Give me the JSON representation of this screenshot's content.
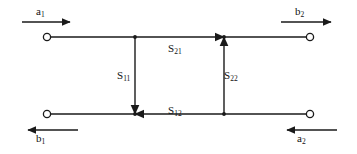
{
  "diagram": {
    "stroke_color": "#1a1a1a",
    "background_color": "#ffffff",
    "node_fill_color": "#ffffff",
    "wave_labels": {
      "incident_port1": "a",
      "incident_port1_sub": "1",
      "reflected_port2": "b",
      "reflected_port2_sub": "2",
      "reflected_port1": "b",
      "reflected_port1_sub": "1",
      "incident_port2": "a",
      "incident_port2_sub": "2"
    },
    "s_parameters": [
      {
        "name": "s21",
        "symbol": "S",
        "subscript": "21",
        "path": "top-horizontal",
        "direction": "right"
      },
      {
        "name": "s11",
        "symbol": "S",
        "subscript": "11",
        "path": "left-vertical",
        "direction": "down"
      },
      {
        "name": "s22",
        "symbol": "S",
        "subscript": "22",
        "path": "right-vertical",
        "direction": "up"
      },
      {
        "name": "s12",
        "symbol": "S",
        "subscript": "12",
        "path": "bottom-horizontal",
        "direction": "left"
      }
    ],
    "nodes": [
      {
        "name": "node-a1",
        "x": 45,
        "y": 37,
        "shape": "open-circle"
      },
      {
        "name": "node-b2",
        "x": 312,
        "y": 37,
        "shape": "open-circle"
      },
      {
        "name": "node-b1",
        "x": 45,
        "y": 114,
        "shape": "open-circle"
      },
      {
        "name": "node-a2",
        "x": 312,
        "y": 114,
        "shape": "open-circle"
      }
    ],
    "junctions": [
      {
        "name": "junction-top-left",
        "x": 135,
        "y": 37
      },
      {
        "name": "junction-top-right",
        "x": 224,
        "y": 37
      },
      {
        "name": "junction-bottom-left",
        "x": 135,
        "y": 114
      },
      {
        "name": "junction-bottom-right",
        "x": 224,
        "y": 114
      }
    ],
    "external_arrows": [
      {
        "name": "arrow-a1",
        "direction": "right",
        "x1": 22,
        "x2": 76,
        "y": 22
      },
      {
        "name": "arrow-b2",
        "direction": "right",
        "x1": 281,
        "x2": 337,
        "y": 22
      },
      {
        "name": "arrow-b1",
        "direction": "left",
        "x1": 78,
        "x2": 22,
        "y": 130
      },
      {
        "name": "arrow-a2",
        "direction": "left",
        "x1": 337,
        "x2": 281,
        "y": 130
      }
    ]
  }
}
